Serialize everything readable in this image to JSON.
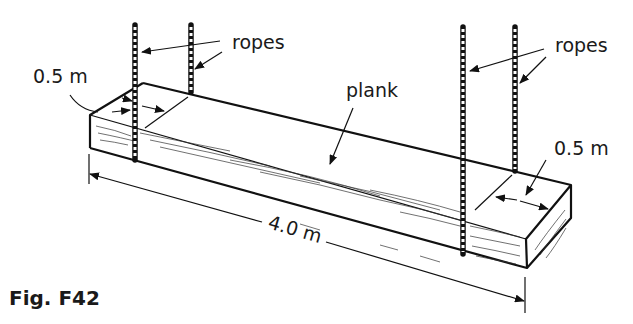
{
  "figure": {
    "caption": "Fig. F42",
    "labels": {
      "ropes_left": "ropes",
      "ropes_right": "ropes",
      "plank": "plank",
      "dim_left_end": "0.5 m",
      "dim_right_end": "0.5 m",
      "dim_length": "4.0 m"
    },
    "components": {
      "plank": {
        "length_m": 4.0,
        "rope_offset_from_each_end_m": 0.5
      },
      "ropes": {
        "count": 4
      }
    },
    "colors": {
      "ink": "#111111",
      "background": "#ffffff"
    }
  }
}
